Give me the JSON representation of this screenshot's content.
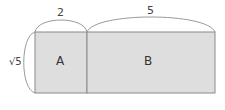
{
  "diagram": {
    "top_labels": {
      "left_width": "2",
      "right_width": "5"
    },
    "side_label": "√5",
    "regions": [
      {
        "id": "A",
        "label": "A"
      },
      {
        "id": "B",
        "label": "B"
      }
    ],
    "colors": {
      "fill": "#dedede",
      "stroke": "#8a8a8a",
      "brace": "#9a9a9a"
    }
  }
}
